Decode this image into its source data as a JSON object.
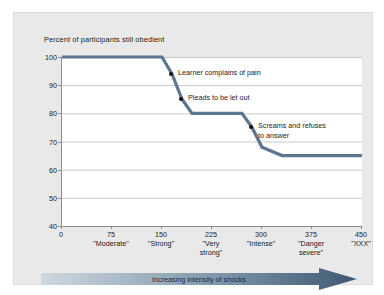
{
  "chart_data": {
    "type": "line",
    "title": "Percent of participants still obedient",
    "xlabel": "Increasing intensity of shocks",
    "ylabel": "Percent of participants still obedient",
    "xlim": [
      0,
      450
    ],
    "ylim": [
      40,
      100
    ],
    "grid": true,
    "legend": "none",
    "y_ticks": [
      100,
      90,
      80,
      70,
      60,
      50,
      40
    ],
    "x_ticks": [
      0,
      75,
      150,
      225,
      300,
      375,
      450
    ],
    "x_tick_labels": [
      {
        "value": "0",
        "descriptor": ""
      },
      {
        "value": "75",
        "descriptor": "\"Moderate\""
      },
      {
        "value": "150",
        "descriptor": "\"Strong\""
      },
      {
        "value": "225",
        "descriptor": "\"Very\nstrong\""
      },
      {
        "value": "300",
        "descriptor": "\"Intense\""
      },
      {
        "value": "375",
        "descriptor": "\"Danger\nsevere\""
      },
      {
        "value": "450",
        "descriptor": "\"XXX\""
      }
    ],
    "series": [
      {
        "name": "Percent still obedient",
        "color": "#5d758f",
        "x": [
          0,
          150,
          165,
          180,
          195,
          270,
          285,
          300,
          330,
          450
        ],
        "values": [
          100,
          100,
          94,
          85,
          80,
          80,
          75,
          68,
          65,
          65
        ]
      }
    ],
    "annotations": [
      {
        "label": "Learner complains of pain",
        "x": 165,
        "y": 94
      },
      {
        "label": "Pleads to be let out",
        "x": 180,
        "y": 85
      },
      {
        "label": "Screams and refuses\nto answer",
        "x": 285,
        "y": 75
      }
    ],
    "arrow": {
      "label": "Increasing intensity of shocks",
      "color_start": "#c7d2dc",
      "color_end": "#3f5770"
    }
  }
}
